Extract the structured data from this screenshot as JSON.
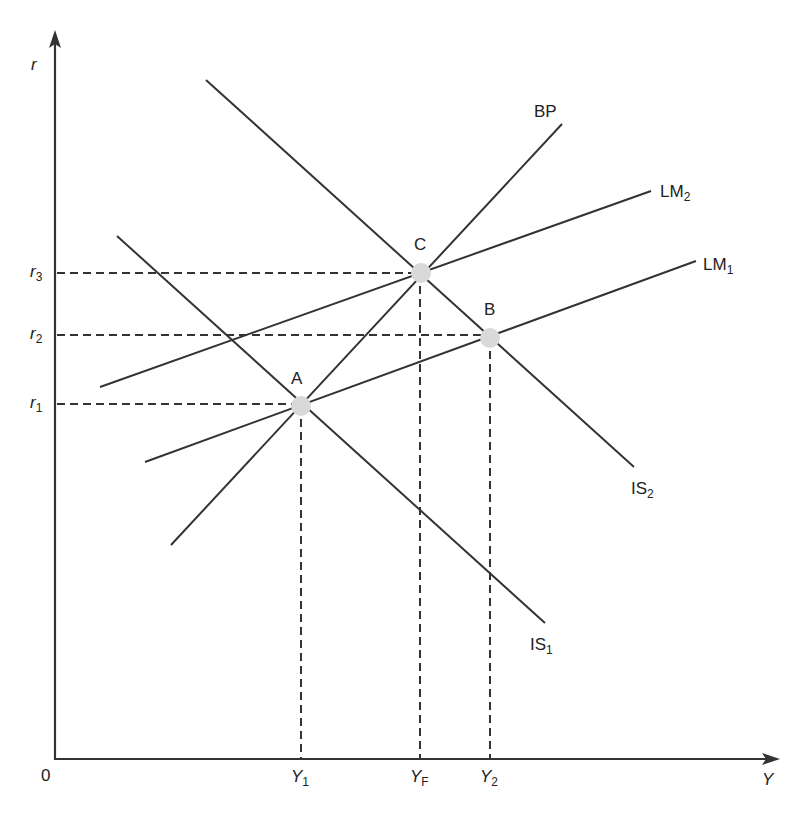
{
  "diagram": {
    "colors": {
      "line": "#333333",
      "dash": "#333333",
      "point": "#d9d9d9",
      "background": "#ffffff"
    },
    "axes": {
      "origin": {
        "x": 55,
        "y": 759,
        "label": "0"
      },
      "y_axis": {
        "label": "r",
        "top": 30
      },
      "x_axis": {
        "label": "Y",
        "right": 780
      }
    },
    "curves": [
      {
        "id": "IS1",
        "base": "IS",
        "sub": "1",
        "x1": 117,
        "y1": 236,
        "x2": 545,
        "y2": 623,
        "label_x": 530,
        "label_y": 636
      },
      {
        "id": "IS2",
        "base": "IS",
        "sub": "2",
        "x1": 206,
        "y1": 80,
        "x2": 634,
        "y2": 467,
        "label_x": 631,
        "label_y": 480
      },
      {
        "id": "LM1",
        "base": "LM",
        "sub": "1",
        "x1": 145,
        "y1": 462,
        "x2": 696,
        "y2": 261,
        "label_x": 703,
        "label_y": 256
      },
      {
        "id": "LM2",
        "base": "LM",
        "sub": "2",
        "x1": 100,
        "y1": 387,
        "x2": 651,
        "y2": 191,
        "label_x": 660,
        "label_y": 183
      },
      {
        "id": "BP",
        "base": "BP",
        "sub": "",
        "x1": 171,
        "y1": 545,
        "x2": 562,
        "y2": 124,
        "label_x": 534,
        "label_y": 103
      }
    ],
    "points": [
      {
        "id": "A",
        "label": "A",
        "x": 301,
        "y": 406,
        "label_x": 291,
        "label_y": 370
      },
      {
        "id": "B",
        "label": "B",
        "x": 490,
        "y": 338,
        "label_x": 484,
        "label_y": 301
      },
      {
        "id": "C",
        "label": "C",
        "x": 421,
        "y": 273,
        "label_x": 414,
        "label_y": 236
      }
    ],
    "guides": {
      "horizontal": [
        {
          "level": "r3",
          "base": "r",
          "sub": "3",
          "y": 273,
          "x_end": 421,
          "label_x": 30,
          "label_y": 263
        },
        {
          "level": "r2",
          "base": "r",
          "sub": "2",
          "y": 335,
          "x_end": 490,
          "label_x": 30,
          "label_y": 325
        },
        {
          "level": "r1",
          "base": "r",
          "sub": "1",
          "y": 404,
          "x_end": 301,
          "label_x": 30,
          "label_y": 394
        }
      ],
      "vertical": [
        {
          "level": "Y1",
          "base": "Y",
          "sub": "1",
          "x": 301,
          "y_start": 406,
          "label_x": 291,
          "label_y": 768
        },
        {
          "level": "YF",
          "base": "Y",
          "sub": "F",
          "x": 420,
          "y_start": 273,
          "label_x": 410,
          "label_y": 768
        },
        {
          "level": "Y2",
          "base": "Y",
          "sub": "2",
          "x": 490,
          "y_start": 338,
          "label_x": 480,
          "label_y": 768
        }
      ]
    }
  },
  "chart_data": {
    "type": "diagram",
    "title": "",
    "xlabel": "Y",
    "ylabel": "r",
    "origin_label": "0",
    "x_ticks": [
      "Y1",
      "YF",
      "Y2"
    ],
    "y_ticks": [
      "r1",
      "r2",
      "r3"
    ],
    "curves": [
      "IS1",
      "IS2",
      "LM1",
      "LM2",
      "BP"
    ],
    "equilibria": [
      {
        "point": "A",
        "intersection": [
          "IS1",
          "LM1",
          "BP"
        ],
        "r": "r1",
        "Y": "Y1"
      },
      {
        "point": "B",
        "intersection": [
          "IS2",
          "LM1"
        ],
        "r": "r2",
        "Y": "Y2"
      },
      {
        "point": "C",
        "intersection": [
          "IS2",
          "LM2",
          "BP"
        ],
        "r": "r3",
        "Y": "YF"
      }
    ]
  }
}
